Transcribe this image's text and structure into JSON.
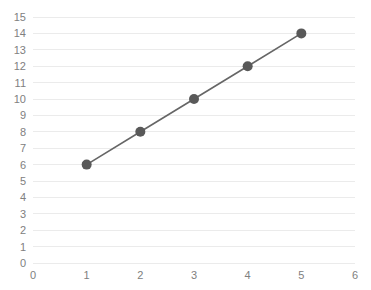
{
  "chart_data": {
    "type": "line",
    "title": "",
    "subtitle": "",
    "xlabel": "",
    "ylabel": "",
    "xlim": [
      0,
      6
    ],
    "ylim": [
      0,
      15
    ],
    "xticks": [
      0,
      1,
      2,
      3,
      4,
      5,
      6
    ],
    "yticks": [
      0,
      1,
      2,
      3,
      4,
      5,
      6,
      7,
      8,
      9,
      10,
      11,
      12,
      13,
      14,
      15
    ],
    "grid": {
      "horizontal": true,
      "vertical": false,
      "color": "#ebebeb"
    },
    "legend": {
      "visible": false,
      "position": "none",
      "entries": []
    },
    "background_color": "#ffffff",
    "axis_label_color": "#808080",
    "series": [
      {
        "name": "Series 1",
        "color": "#666666",
        "marker": "circle",
        "marker_color": "#595959",
        "marker_size": 5,
        "line_width": 1.6,
        "x": [
          1,
          2,
          3,
          4,
          5
        ],
        "values": [
          6,
          8,
          10,
          12,
          14
        ],
        "points": [
          {
            "x": 1,
            "y": 6
          },
          {
            "x": 2,
            "y": 8
          },
          {
            "x": 3,
            "y": 10
          },
          {
            "x": 4,
            "y": 12
          },
          {
            "x": 5,
            "y": 14
          }
        ]
      }
    ]
  },
  "plot_geometry": {
    "left": 33,
    "right": 355,
    "top": 17,
    "bottom": 263,
    "xtick_label_y": 279,
    "ytick_label_x": 26
  }
}
